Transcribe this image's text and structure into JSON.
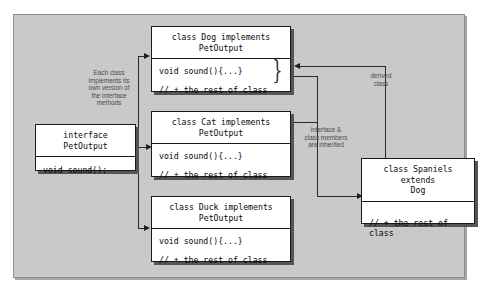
{
  "diagram": {
    "panel_color": "#c9c9c9",
    "box_fill": "#ffffff",
    "border_color": "#1a1a1a",
    "shadow_color": "#555555"
  },
  "boxes": {
    "interface": {
      "header": "interface\nPetOutput",
      "lines": [
        "void sound();"
      ]
    },
    "dog": {
      "header": "class Dog implements\nPetOutput",
      "lines": [
        "void sound(){...}",
        "// + the rest of class"
      ],
      "brace": "}"
    },
    "cat": {
      "header": "class Cat implements\nPetOutput",
      "lines": [
        "void sound(){...}",
        "// + the rest of class"
      ]
    },
    "duck": {
      "header": "class Duck implements\nPetOutput",
      "lines": [
        "void sound(){...}",
        "// + the rest of class"
      ]
    },
    "spaniels": {
      "header": "class Spaniels extends\nDog",
      "lines": [
        "// + the rest of class"
      ]
    }
  },
  "notes": {
    "implements": "Each class\nimplements its\nown version of\nthe interface\nmethods",
    "inherited": "interface &\nclass members\nare inherited",
    "derived": "derived\nclass"
  }
}
